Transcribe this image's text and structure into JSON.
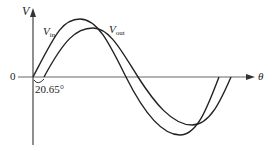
{
  "diagram": {
    "axis_y_label": "V",
    "axis_x_label": "θ",
    "origin_label": "0",
    "phase_label": "20.65°",
    "curves": [
      {
        "name": "V",
        "sub": "in",
        "description": "input sine wave"
      },
      {
        "name": "V",
        "sub": "out",
        "description": "output sine wave lagging by 20.65°"
      }
    ],
    "line_color": "#222222"
  }
}
